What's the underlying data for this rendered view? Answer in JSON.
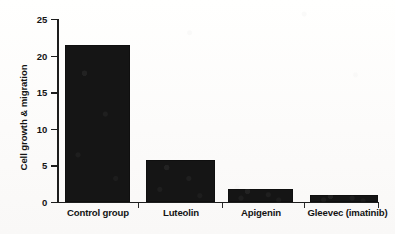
{
  "chart_data": {
    "type": "bar",
    "title": "",
    "xlabel": "",
    "ylabel": "Cell growth & migration",
    "categories": [
      "Control group",
      "Luteolin",
      "Apigenin",
      "Gleevec (imatinib)"
    ],
    "values": [
      21.4,
      5.7,
      1.8,
      0.95
    ],
    "ylim": [
      0,
      25
    ],
    "yticks": [
      0,
      5,
      10,
      15,
      20,
      25
    ],
    "ytick_labels": [
      "0",
      "5",
      "10",
      "15",
      "20",
      "25"
    ],
    "grid": false,
    "legend": null,
    "bar_color": "#151515",
    "axis_color": "#1d1d1d",
    "background_color": "#fdfdfc",
    "annotations": []
  },
  "axis": {
    "y_title": "Cell growth & migration",
    "ticks": [
      {
        "label": "25",
        "value": 25
      },
      {
        "label": "20",
        "value": 20
      },
      {
        "label": "15",
        "value": 15
      },
      {
        "label": "10",
        "value": 10
      },
      {
        "label": "5",
        "value": 5
      },
      {
        "label": "0",
        "value": 0
      }
    ]
  },
  "bars": [
    {
      "label": "Control group",
      "value": 21.4
    },
    {
      "label": "Luteolin",
      "value": 5.7
    },
    {
      "label": "Apigenin",
      "value": 1.8
    },
    {
      "label": "Gleevec (imatinib)",
      "value": 0.95
    }
  ]
}
